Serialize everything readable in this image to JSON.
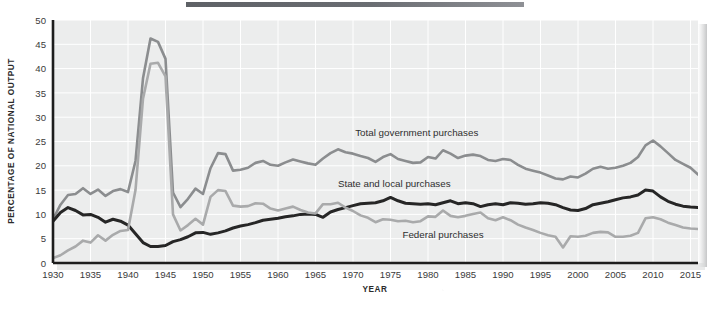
{
  "figure": {
    "name": "government-purchases-share-of-national-output",
    "background_color": "#ffffff",
    "plot_background_color": "#eceded",
    "grid_color": "#ffffff",
    "axis_color": "#1d1d1d",
    "top_rule_color": "#6a6d72"
  },
  "chart_data": {
    "type": "line",
    "title": "",
    "xlabel": "YEAR",
    "ylabel": "PERCENTAGE OF NATIONAL OUTPUT",
    "xlim": [
      1930,
      2016
    ],
    "ylim": [
      0,
      50
    ],
    "xticks": [
      1930,
      1935,
      1940,
      1945,
      1950,
      1955,
      1960,
      1965,
      1970,
      1975,
      1980,
      1985,
      1990,
      1995,
      2000,
      2005,
      2010,
      2015
    ],
    "yticks": [
      0,
      5,
      10,
      15,
      20,
      25,
      30,
      35,
      40,
      45,
      50
    ],
    "grid": true,
    "grid_axis": "both",
    "legend": "inline-annotations",
    "x": [
      1930,
      1931,
      1932,
      1933,
      1934,
      1935,
      1936,
      1937,
      1938,
      1939,
      1940,
      1941,
      1942,
      1943,
      1944,
      1945,
      1946,
      1947,
      1948,
      1949,
      1950,
      1951,
      1952,
      1953,
      1954,
      1955,
      1956,
      1957,
      1958,
      1959,
      1960,
      1961,
      1962,
      1963,
      1964,
      1965,
      1966,
      1967,
      1968,
      1969,
      1970,
      1971,
      1972,
      1973,
      1974,
      1975,
      1976,
      1977,
      1978,
      1979,
      1980,
      1981,
      1982,
      1983,
      1984,
      1985,
      1986,
      1987,
      1988,
      1989,
      1990,
      1991,
      1992,
      1993,
      1994,
      1995,
      1996,
      1997,
      1998,
      1999,
      2000,
      2001,
      2002,
      2003,
      2004,
      2005,
      2006,
      2007,
      2008,
      2009,
      2010,
      2011,
      2012,
      2013,
      2014,
      2015,
      2016
    ],
    "series": [
      {
        "name": "Total government purchases",
        "color": "#8b8d8f",
        "linewidth": 2.6,
        "label_position": {
          "x": 1978.5,
          "y": 26.2
        },
        "values": [
          9.0,
          12.0,
          14.0,
          14.2,
          15.4,
          14.2,
          15.1,
          13.8,
          14.8,
          15.2,
          14.6,
          21.0,
          38.0,
          46.2,
          45.5,
          42.0,
          14.5,
          11.5,
          13.2,
          15.3,
          14.2,
          19.5,
          22.6,
          22.4,
          19.0,
          19.2,
          19.6,
          20.6,
          21.0,
          20.2,
          20.0,
          20.7,
          21.3,
          20.9,
          20.5,
          20.2,
          21.5,
          22.6,
          23.4,
          22.8,
          22.5,
          22.0,
          21.6,
          20.8,
          21.8,
          22.4,
          21.4,
          21.0,
          20.6,
          20.7,
          21.8,
          21.5,
          23.2,
          22.5,
          21.6,
          22.1,
          22.3,
          22.0,
          21.2,
          21.0,
          21.4,
          21.2,
          20.2,
          19.4,
          19.0,
          18.6,
          18.0,
          17.4,
          17.2,
          17.8,
          17.6,
          18.4,
          19.4,
          19.8,
          19.4,
          19.6,
          20.0,
          20.6,
          21.8,
          24.2,
          25.2,
          24.0,
          22.6,
          21.2,
          20.4,
          19.6,
          18.2
        ]
      },
      {
        "name": "State and local purchases",
        "color": "#262626",
        "linewidth": 3.0,
        "label_position": {
          "x": 1975.5,
          "y": 15.6
        },
        "values": [
          8.6,
          10.4,
          11.4,
          10.8,
          9.9,
          10.0,
          9.4,
          8.4,
          9.0,
          8.6,
          7.8,
          6.0,
          4.2,
          3.4,
          3.4,
          3.6,
          4.4,
          4.8,
          5.4,
          6.2,
          6.3,
          5.9,
          6.2,
          6.6,
          7.2,
          7.6,
          7.9,
          8.3,
          8.8,
          9.0,
          9.2,
          9.5,
          9.7,
          10.0,
          10.1,
          10.0,
          9.4,
          10.5,
          11.0,
          11.4,
          11.8,
          12.2,
          12.3,
          12.4,
          12.8,
          13.5,
          12.8,
          12.3,
          12.2,
          12.1,
          12.2,
          12.0,
          12.4,
          12.8,
          12.2,
          12.4,
          12.2,
          11.6,
          12.0,
          12.2,
          12.0,
          12.4,
          12.3,
          12.1,
          12.2,
          12.4,
          12.3,
          12.0,
          11.4,
          10.9,
          10.8,
          11.2,
          12.0,
          12.3,
          12.6,
          13.0,
          13.4,
          13.6,
          14.0,
          15.0,
          14.8,
          13.6,
          12.7,
          12.1,
          11.7,
          11.5,
          11.4
        ]
      },
      {
        "name": "Federal purchases",
        "color": "#a9aaab",
        "linewidth": 2.6,
        "label_position": {
          "x": 1982.0,
          "y": 5.1
        },
        "values": [
          1.0,
          1.6,
          2.6,
          3.4,
          4.6,
          4.2,
          5.7,
          4.6,
          5.8,
          6.6,
          6.8,
          15.0,
          33.8,
          41.0,
          41.2,
          38.4,
          10.0,
          6.7,
          7.8,
          9.1,
          7.9,
          13.6,
          15.0,
          14.8,
          11.8,
          11.6,
          11.7,
          12.3,
          12.2,
          11.2,
          10.8,
          11.2,
          11.6,
          10.9,
          10.4,
          10.2,
          12.1,
          12.1,
          12.4,
          11.4,
          10.7,
          9.8,
          9.3,
          8.4,
          9.0,
          8.9,
          8.6,
          8.7,
          8.4,
          8.6,
          9.6,
          9.5,
          10.8,
          9.7,
          9.4,
          9.7,
          10.1,
          10.4,
          9.2,
          8.8,
          9.4,
          8.8,
          7.9,
          7.3,
          6.8,
          6.2,
          5.7,
          5.4,
          3.2,
          5.5,
          5.4,
          5.6,
          6.2,
          6.4,
          6.3,
          5.4,
          5.4,
          5.6,
          6.2,
          9.2,
          9.4,
          9.0,
          8.3,
          7.8,
          7.3,
          7.1,
          7.0
        ]
      }
    ]
  },
  "annotations": {
    "total_label": "Total government purchases",
    "state_local_label": "State and local purchases",
    "federal_label": "Federal purchases"
  },
  "axis": {
    "y_title": "PERCENTAGE OF NATIONAL OUTPUT",
    "x_title": "YEAR"
  }
}
